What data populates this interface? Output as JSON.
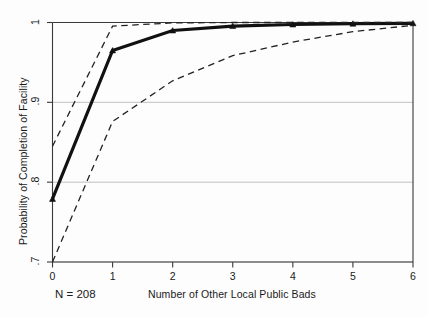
{
  "chart_data": {
    "type": "line",
    "title": "",
    "subtitle": "",
    "xlabel": "Number of Other Local Public Bads",
    "ylabel": "Probability of Completion of Facility",
    "annotation": "N = 208",
    "x": [
      0,
      1,
      2,
      3,
      4,
      5,
      6
    ],
    "xlim": [
      0,
      6
    ],
    "ylim": [
      0.7,
      1.0
    ],
    "xticks": [
      0,
      1,
      2,
      3,
      4,
      5,
      6
    ],
    "xtick_labels": [
      "0",
      "1",
      "2",
      "3",
      "4",
      "5",
      "6"
    ],
    "yticks": [
      0.7,
      0.8,
      0.9,
      1.0
    ],
    "ytick_labels": [
      ".7",
      ".8",
      ".9",
      "1"
    ],
    "grid": "horizontal",
    "grid_color": "#b9b9b9",
    "legend": "none",
    "series": [
      {
        "name": "Predicted probability",
        "style": "solid",
        "color": "#111111",
        "linewidth": 3.2,
        "markers": true,
        "marker": "triangle",
        "values": [
          0.779,
          0.965,
          0.99,
          0.9955,
          0.9975,
          0.9985,
          0.999
        ]
      },
      {
        "name": "Upper 95% confidence bound",
        "style": "dashed",
        "color": "#222222",
        "linewidth": 1.3,
        "markers": false,
        "values": [
          0.845,
          0.9955,
          0.9995,
          1.0,
          1.0,
          1.0,
          1.0
        ]
      },
      {
        "name": "Lower 95% confidence bound",
        "style": "dashed",
        "color": "#222222",
        "linewidth": 1.3,
        "markers": false,
        "values": [
          0.7,
          0.876,
          0.927,
          0.9585,
          0.9755,
          0.9885,
          0.9965
        ]
      }
    ]
  },
  "figure": {
    "background": "#fdfdfd",
    "frame_color": "#3a3a3a"
  }
}
